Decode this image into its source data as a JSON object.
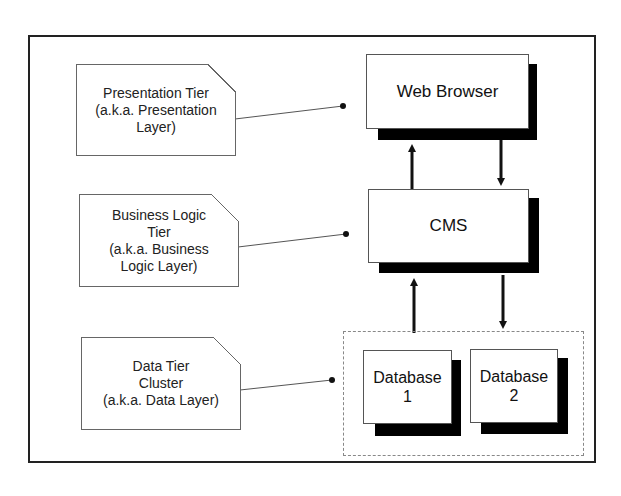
{
  "notes": {
    "presentation": "Presentation Tier (a.k.a. Presentation Layer)",
    "presentation_lines": [
      "Presentation Tier",
      "(a.k.a. Presentation",
      "Layer)"
    ],
    "business": [
      "Business Logic",
      "Tier",
      "(a.k.a. Business",
      "Logic Layer)"
    ],
    "data": [
      "Data Tier",
      "Cluster",
      "(a.k.a. Data Layer)"
    ]
  },
  "components": {
    "web_browser": "Web Browser",
    "cms": "CMS",
    "database1": [
      "Database",
      "1"
    ],
    "database2": [
      "Database",
      "2"
    ]
  }
}
